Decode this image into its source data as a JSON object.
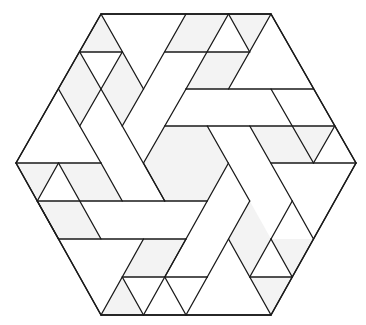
{
  "diagram": {
    "title": "",
    "colors": {
      "background": "#ffffff",
      "stroke": "#1a1a1a",
      "shade": "#f3f3f3"
    },
    "lattice": {
      "origin_x": 16,
      "origin_y": 14,
      "unit": 42.5,
      "row_height": 37.6,
      "hex_side_units": 4
    },
    "outline": [
      [
        101,
        14
      ],
      [
        271,
        14
      ],
      [
        356,
        163
      ],
      [
        271,
        315
      ],
      [
        101,
        315
      ],
      [
        16,
        163
      ]
    ],
    "center_hexagon": [
      [
        164.75,
        126
      ],
      [
        207.25,
        126
      ],
      [
        228.5,
        163
      ],
      [
        207.25,
        201
      ],
      [
        164.75,
        201
      ],
      [
        143.5,
        163
      ]
    ],
    "shaded_regions": [
      [
        [
          101,
          14
        ],
        [
          79.75,
          52
        ],
        [
          122.25,
          52
        ]
      ],
      [
        [
          79.75,
          52
        ],
        [
          101,
          89
        ],
        [
          79.75,
          126
        ],
        [
          58.5,
          89
        ]
      ],
      [
        [
          122.25,
          52
        ],
        [
          143.5,
          89
        ],
        [
          122.25,
          126
        ],
        [
          101,
          89
        ]
      ],
      [
        [
          186,
          14
        ],
        [
          228.5,
          14
        ],
        [
          207.25,
          52
        ],
        [
          164.75,
          52
        ]
      ],
      [
        [
          228.5,
          14
        ],
        [
          271,
          14
        ],
        [
          249.75,
          52
        ]
      ],
      [
        [
          207.25,
          52
        ],
        [
          249.75,
          52
        ],
        [
          228.5,
          89
        ],
        [
          186,
          89
        ]
      ],
      [
        [
          249.75,
          126
        ],
        [
          334.75,
          126
        ],
        [
          313.5,
          163
        ],
        [
          271,
          163
        ]
      ],
      [
        [
          292.25,
          126
        ],
        [
          313.5,
          163
        ],
        [
          271,
          163
        ]
      ],
      [
        [
          16,
          163
        ],
        [
          58.5,
          163
        ],
        [
          37.25,
          201
        ]
      ],
      [
        [
          58.5,
          163
        ],
        [
          101,
          163
        ],
        [
          122.25,
          201
        ],
        [
          79.75,
          201
        ]
      ],
      [
        [
          37.25,
          201
        ],
        [
          79.75,
          201
        ],
        [
          101,
          239
        ],
        [
          58.5,
          239
        ]
      ],
      [
        [
          143.5,
          239
        ],
        [
          186,
          239
        ],
        [
          164.75,
          277
        ],
        [
          122.25,
          277
        ]
      ],
      [
        [
          122.25,
          277
        ],
        [
          143.5,
          315
        ],
        [
          101,
          315
        ]
      ],
      [
        [
          228.5,
          239
        ],
        [
          249.75,
          201
        ],
        [
          271,
          239
        ],
        [
          249.75,
          277
        ]
      ],
      [
        [
          249.75,
          277
        ],
        [
          292.25,
          277
        ],
        [
          271,
          315
        ]
      ],
      [
        [
          313.5,
          239
        ],
        [
          292.25,
          277
        ],
        [
          271,
          239
        ]
      ]
    ],
    "segments": [
      [
        [
          101,
          14
        ],
        [
          271,
          14
        ]
      ],
      [
        [
          271,
          14
        ],
        [
          356,
          163
        ]
      ],
      [
        [
          356,
          163
        ],
        [
          271,
          315
        ]
      ],
      [
        [
          271,
          315
        ],
        [
          101,
          315
        ]
      ],
      [
        [
          101,
          315
        ],
        [
          16,
          163
        ]
      ],
      [
        [
          16,
          163
        ],
        [
          101,
          14
        ]
      ],
      [
        [
          79.75,
          52
        ],
        [
          122.25,
          52
        ]
      ],
      [
        [
          101,
          14
        ],
        [
          143.5,
          89
        ]
      ],
      [
        [
          122.25,
          52
        ],
        [
          101,
          89
        ]
      ],
      [
        [
          79.75,
          52
        ],
        [
          122.25,
          126
        ]
      ],
      [
        [
          101,
          89
        ],
        [
          79.75,
          126
        ]
      ],
      [
        [
          58.5,
          89
        ],
        [
          101,
          163
        ]
      ],
      [
        [
          122.25,
          126
        ],
        [
          164.75,
          201
        ]
      ],
      [
        [
          143.5,
          89
        ],
        [
          122.25,
          126
        ]
      ],
      [
        [
          164.75,
          52
        ],
        [
          249.75,
          52
        ]
      ],
      [
        [
          186,
          14
        ],
        [
          143.5,
          89
        ]
      ],
      [
        [
          228.5,
          14
        ],
        [
          249.75,
          52
        ]
      ],
      [
        [
          228.5,
          14
        ],
        [
          186,
          89
        ]
      ],
      [
        [
          271,
          14
        ],
        [
          228.5,
          89
        ]
      ],
      [
        [
          186,
          89
        ],
        [
          313.5,
          89
        ]
      ],
      [
        [
          186,
          89
        ],
        [
          143.5,
          163
        ]
      ],
      [
        [
          164.75,
          126
        ],
        [
          334.75,
          126
        ]
      ],
      [
        [
          271,
          89
        ],
        [
          313.5,
          163
        ]
      ],
      [
        [
          334.75,
          126
        ],
        [
          313.5,
          163
        ]
      ],
      [
        [
          207.25,
          126
        ],
        [
          249.75,
          201
        ]
      ],
      [
        [
          249.75,
          126
        ],
        [
          292.25,
          201
        ]
      ],
      [
        [
          271,
          163
        ],
        [
          356,
          163
        ]
      ],
      [
        [
          16,
          163
        ],
        [
          101,
          163
        ]
      ],
      [
        [
          58.5,
          163
        ],
        [
          37.25,
          201
        ]
      ],
      [
        [
          58.5,
          163
        ],
        [
          101,
          239
        ]
      ],
      [
        [
          101,
          163
        ],
        [
          122.25,
          201
        ]
      ],
      [
        [
          37.25,
          201
        ],
        [
          207.25,
          201
        ]
      ],
      [
        [
          37.25,
          201
        ],
        [
          58.5,
          239
        ]
      ],
      [
        [
          58.5,
          239
        ],
        [
          186,
          239
        ]
      ],
      [
        [
          143.5,
          163
        ],
        [
          164.75,
          201
        ]
      ],
      [
        [
          228.5,
          163
        ],
        [
          164.75,
          277
        ]
      ],
      [
        [
          292.25,
          201
        ],
        [
          313.5,
          239
        ]
      ],
      [
        [
          249.75,
          201
        ],
        [
          207.25,
          277
        ]
      ],
      [
        [
          292.25,
          201
        ],
        [
          271,
          239
        ]
      ],
      [
        [
          143.5,
          239
        ],
        [
          101,
          315
        ]
      ],
      [
        [
          186,
          239
        ],
        [
          143.5,
          315
        ]
      ],
      [
        [
          122.25,
          277
        ],
        [
          207.25,
          277
        ]
      ],
      [
        [
          122.25,
          277
        ],
        [
          143.5,
          315
        ]
      ],
      [
        [
          207.25,
          277
        ],
        [
          186,
          315
        ]
      ],
      [
        [
          228.5,
          239
        ],
        [
          271,
          315
        ]
      ],
      [
        [
          249.75,
          277
        ],
        [
          292.25,
          277
        ]
      ],
      [
        [
          271,
          239
        ],
        [
          249.75,
          277
        ]
      ],
      [
        [
          271,
          239
        ],
        [
          292.25,
          277
        ]
      ],
      [
        [
          164.75,
          277
        ],
        [
          186,
          315
        ]
      ]
    ]
  }
}
